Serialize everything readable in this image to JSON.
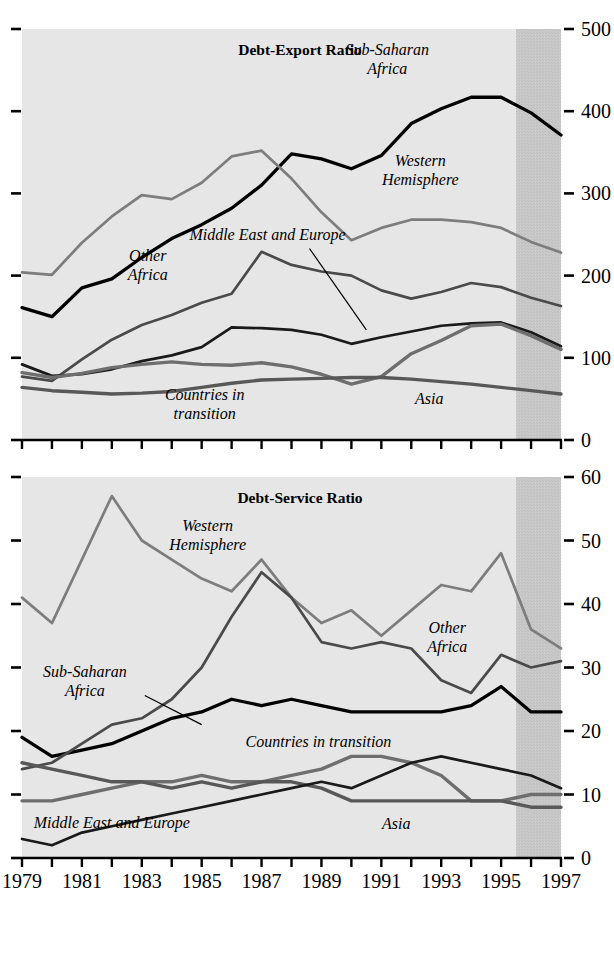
{
  "figure": {
    "x_axis": {
      "label_years": [
        "1979",
        "1981",
        "1983",
        "1985",
        "1987",
        "1989",
        "1991",
        "1993",
        "1995",
        "1997"
      ],
      "tick_years": [
        1979,
        1980,
        1981,
        1982,
        1983,
        1984,
        1985,
        1986,
        1987,
        1988,
        1989,
        1990,
        1991,
        1992,
        1993,
        1994,
        1995,
        1996,
        1997
      ],
      "min": 1979,
      "max": 1997
    },
    "shaded_forecast": {
      "start_year": 1995.5,
      "end_year": 1997,
      "color": "#c9c9c9"
    },
    "plot_background": "#e6e6e6",
    "colors": {
      "sub_saharan_africa": "#000000",
      "western_hemisphere": "#7d7d7d",
      "other_africa": "#4a4a4a",
      "middle_east_and_europe": "#1a1a1a",
      "countries_in_transition": "#6e6e6e",
      "asia": "#585858"
    }
  },
  "chart_data": [
    {
      "type": "line",
      "title": "Debt-Export Ratio",
      "xlabel": "",
      "ylabel": "",
      "ylim": [
        0,
        500
      ],
      "yticks": [
        0,
        100,
        200,
        300,
        400,
        500
      ],
      "ytick_labels": [
        "0",
        "100",
        "200",
        "300",
        "400",
        "500"
      ],
      "grid": false,
      "legend_position": "inline-annotations",
      "x": [
        1979,
        1980,
        1981,
        1982,
        1983,
        1984,
        1985,
        1986,
        1987,
        1988,
        1989,
        1990,
        1991,
        1992,
        1993,
        1994,
        1995,
        1996,
        1997
      ],
      "series": [
        {
          "name": "Sub-Saharan Africa",
          "color": "#000000",
          "label_x": 1991.2,
          "label_y": 468,
          "values": [
            161,
            150,
            185,
            196,
            222,
            245,
            262,
            282,
            310,
            348,
            342,
            330,
            346,
            385,
            403,
            417,
            417,
            398,
            371
          ]
        },
        {
          "name": "Western Hemisphere",
          "color": "#7d7d7d",
          "label_x": 1992.3,
          "label_y": 333,
          "values": [
            204,
            201,
            240,
            272,
            298,
            293,
            313,
            345,
            352,
            318,
            277,
            243,
            258,
            268,
            268,
            265,
            258,
            241,
            228
          ]
        },
        {
          "name": "Other Africa",
          "color": "#4a4a4a",
          "label_x": 1983.2,
          "label_y": 218,
          "values": [
            77,
            72,
            98,
            122,
            140,
            152,
            167,
            178,
            229,
            213,
            205,
            200,
            182,
            172,
            180,
            191,
            186,
            173,
            163
          ]
        },
        {
          "name": "Middle East and Europe",
          "color": "#1a1a1a",
          "label_x": 1987.2,
          "label_y": 243,
          "leader_from": [
            1988.6,
            233
          ],
          "leader_to": [
            1990.5,
            134
          ],
          "values": [
            92,
            78,
            80,
            86,
            96,
            103,
            113,
            137,
            136,
            134,
            128,
            117,
            125,
            132,
            139,
            142,
            143,
            131,
            114
          ]
        },
        {
          "name": "Countries in transition",
          "color": "#6e6e6e",
          "label_x": 1985.1,
          "label_y": 49,
          "values": [
            82,
            76,
            81,
            88,
            92,
            95,
            92,
            91,
            94,
            89,
            80,
            68,
            77,
            105,
            121,
            139,
            141,
            127,
            110
          ]
        },
        {
          "name": "Asia",
          "color": "#585858",
          "label_x": 1992.6,
          "label_y": 44,
          "values": [
            64,
            60,
            58,
            56,
            57,
            59,
            64,
            69,
            73,
            74,
            75,
            76,
            76,
            74,
            71,
            68,
            64,
            60,
            56
          ]
        }
      ]
    },
    {
      "type": "line",
      "title": "Debt-Service Ratio",
      "xlabel": "",
      "ylabel": "",
      "ylim": [
        0,
        60
      ],
      "yticks": [
        0,
        10,
        20,
        30,
        40,
        50,
        60
      ],
      "ytick_labels": [
        "0",
        "10",
        "20",
        "30",
        "40",
        "50",
        "60"
      ],
      "grid": false,
      "legend_position": "inline-annotations",
      "x": [
        1979,
        1980,
        1981,
        1982,
        1983,
        1984,
        1985,
        1986,
        1987,
        1988,
        1989,
        1990,
        1991,
        1992,
        1993,
        1994,
        1995,
        1996,
        1997
      ],
      "series": [
        {
          "name": "Western Hemisphere",
          "color": "#7d7d7d",
          "label_x": 1985.2,
          "label_y": 51.5,
          "values": [
            41,
            37,
            47,
            57,
            50,
            47,
            44,
            42,
            47,
            41,
            37,
            39,
            35,
            39,
            43,
            42,
            48,
            36,
            33
          ]
        },
        {
          "name": "Sub-Saharan Africa",
          "color": "#000000",
          "label_x": 1981.1,
          "label_y": 28.5,
          "leader_from": [
            1983.1,
            25.6
          ],
          "leader_to": [
            1985.0,
            21.0
          ],
          "values": [
            19,
            16,
            17,
            18,
            20,
            22,
            23,
            25,
            24,
            25,
            24,
            23,
            23,
            23,
            23,
            24,
            27,
            23,
            23
          ]
        },
        {
          "name": "Other Africa",
          "color": "#4a4a4a",
          "label_x": 1993.2,
          "label_y": 35.5,
          "values": [
            14,
            15,
            18,
            21,
            22,
            25,
            30,
            38,
            45,
            41,
            34,
            33,
            34,
            33,
            28,
            26,
            32,
            30,
            31
          ]
        },
        {
          "name": "Countries in transition",
          "color": "#6e6e6e",
          "label_x": 1988.9,
          "label_y": 17.5,
          "values": [
            9,
            9,
            10,
            11,
            12,
            12,
            13,
            12,
            12,
            13,
            14,
            16,
            16,
            15,
            13,
            9,
            9,
            10,
            10
          ]
        },
        {
          "name": "Asia",
          "color": "#585858",
          "label_x": 1991.5,
          "label_y": 4.6,
          "values": [
            15,
            14,
            13,
            12,
            12,
            11,
            12,
            11,
            12,
            12,
            11,
            9,
            9,
            9,
            9,
            9,
            9,
            8,
            8
          ]
        },
        {
          "name": "Middle East and Europe",
          "color": "#1a1a1a",
          "label_x": 1982.0,
          "label_y": 4.8,
          "values": [
            3,
            2,
            4,
            5,
            6,
            7,
            8,
            9,
            10,
            11,
            12,
            11,
            13,
            15,
            16,
            15,
            14,
            13,
            11
          ]
        }
      ]
    }
  ]
}
